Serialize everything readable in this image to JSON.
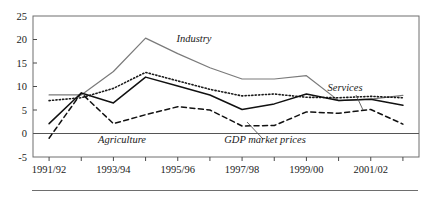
{
  "chart_data": {
    "type": "line",
    "title": "",
    "xlabel": "",
    "ylabel": "",
    "ylim": [
      -5,
      25
    ],
    "yticks": [
      -5,
      0,
      5,
      10,
      15,
      20,
      25
    ],
    "ytick_labels": [
      "-5",
      "0",
      "5",
      "10",
      "15",
      "20",
      "25"
    ],
    "grid": false,
    "legend_position": "inline-annotations",
    "x": [
      "1991/92",
      "1992/93",
      "1993/94",
      "1994/95",
      "1995/96",
      "1996/97",
      "1997/98",
      "1998/99",
      "1999/00",
      "2000/01",
      "2001/02",
      "2002/03"
    ],
    "xtick_labels": [
      "1991/92",
      "",
      "1993/94",
      "",
      "1995/96",
      "",
      "1997/98",
      "",
      "1999/00",
      "",
      "2001/02",
      ""
    ],
    "xtick_labels_shown": [
      "1991/92",
      "1993/94",
      "1995/96",
      "1997/98",
      "1999/00",
      "2001/02"
    ],
    "zero_line": 0,
    "series": [
      {
        "name": "Industry",
        "style": "solid-grey",
        "color": "#7a7a7a",
        "values": [
          8.2,
          8.2,
          13.2,
          20.3,
          17.0,
          14.0,
          11.6,
          11.6,
          12.3,
          7.0,
          7.3,
          8.1
        ]
      },
      {
        "name": "Services",
        "style": "dotted",
        "color": "#1a1a1a",
        "values": [
          7.0,
          7.6,
          9.6,
          13.0,
          11.2,
          9.4,
          8.0,
          8.4,
          7.7,
          7.6,
          7.9,
          7.6
        ]
      },
      {
        "name": "GDP market prices",
        "style": "solid-black",
        "color": "#111111",
        "values": [
          2.1,
          8.6,
          6.5,
          12.0,
          10.1,
          8.2,
          5.1,
          6.3,
          8.4,
          7.0,
          7.3,
          6.0
        ]
      },
      {
        "name": "Agriculture",
        "style": "dashed",
        "color": "#111111",
        "values": [
          -1.0,
          8.6,
          2.1,
          4.0,
          5.7,
          5.0,
          1.6,
          1.7,
          4.6,
          4.3,
          5.1,
          2.0
        ]
      }
    ],
    "annotations": [
      {
        "text": "Industry",
        "x": 194,
        "y": 42,
        "leader": null
      },
      {
        "text": "Services",
        "x": 345,
        "y": 91,
        "leader": {
          "x1": 356,
          "y1": 95,
          "x2": 363,
          "y2": 110
        }
      },
      {
        "text": "Agriculture",
        "x": 122,
        "y": 143,
        "leader": null
      },
      {
        "text": "GDP market prices",
        "x": 265,
        "y": 143,
        "leader": {
          "x1": 263,
          "y1": 139,
          "x2": 247,
          "y2": 122
        }
      }
    ]
  },
  "caption": {
    "rule": true,
    "text": ""
  }
}
